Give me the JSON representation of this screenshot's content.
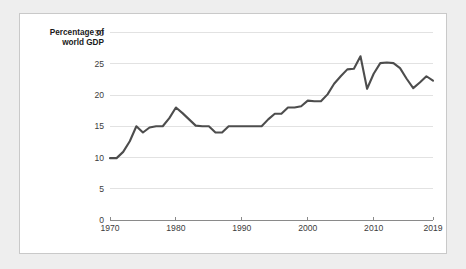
{
  "card": {
    "background_color": "#ffffff",
    "border_color": "#c9c9c9",
    "page_background_color": "#eeeeee"
  },
  "chart_data": {
    "type": "line",
    "title": "",
    "subtitle": "",
    "xlabel": "",
    "ylabel": "Percentage of world GDP",
    "ylabel_line1": "Percentage of",
    "ylabel_line2": "world GDP",
    "series_color": "#4d4d4d",
    "grid": true,
    "grid_axis": "y",
    "legend": "none",
    "xlim": [
      1970,
      2019
    ],
    "ylim": [
      0,
      30
    ],
    "xticks": [
      1970,
      1980,
      1990,
      2000,
      2010,
      2019
    ],
    "xtick_labels": [
      "1970",
      "1980",
      "1990",
      "2000",
      "2010",
      "2019"
    ],
    "yticks": [
      0,
      5,
      10,
      15,
      20,
      25,
      30
    ],
    "ytick_labels": [
      "0",
      "5",
      "10",
      "15",
      "20",
      "25",
      "30"
    ],
    "x": [
      1970,
      1971,
      1972,
      1973,
      1974,
      1975,
      1976,
      1977,
      1978,
      1979,
      1980,
      1981,
      1982,
      1983,
      1984,
      1985,
      1986,
      1987,
      1988,
      1989,
      1990,
      1991,
      1992,
      1993,
      1994,
      1995,
      1996,
      1997,
      1998,
      1999,
      2000,
      2001,
      2002,
      2003,
      2004,
      2005,
      2006,
      2007,
      2008,
      2009,
      2010,
      2011,
      2012,
      2013,
      2014,
      2015,
      2016,
      2017,
      2018,
      2019
    ],
    "values": [
      9.9,
      9.9,
      10.9,
      12.6,
      15.0,
      14.0,
      14.8,
      15.0,
      15.0,
      16.3,
      18.0,
      17.1,
      16.1,
      15.1,
      15.0,
      15.0,
      14.0,
      14.0,
      15.0,
      15.0,
      15.0,
      15.0,
      15.0,
      15.0,
      16.1,
      17.0,
      17.0,
      18.0,
      18.0,
      18.2,
      19.1,
      19.0,
      19.0,
      20.1,
      21.8,
      23.0,
      24.1,
      24.2,
      26.2,
      21.0,
      23.4,
      25.1,
      25.2,
      25.1,
      24.3,
      22.6,
      21.1,
      22.0,
      23.0,
      22.3
    ],
    "annotations": []
  }
}
